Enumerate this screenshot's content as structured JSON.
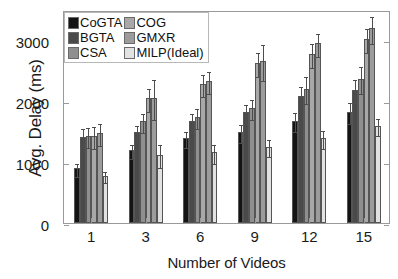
{
  "chart_data": {
    "type": "bar",
    "title": "",
    "xlabel": "Number of Videos",
    "ylabel": "Avg. Delay (ms)",
    "categories": [
      "1",
      "3",
      "6",
      "9",
      "12",
      "15"
    ],
    "ylim": [
      0,
      3500
    ],
    "yticks": [
      0,
      1000,
      2000,
      3000
    ],
    "ytick_labels": [
      "0",
      "1000",
      "2000",
      "3000"
    ],
    "grid": false,
    "legend_position": "upper-left-inside",
    "error_bars": true,
    "series": [
      {
        "name": "CoGTA",
        "color": "#141414",
        "values": [
          900,
          1200,
          1400,
          1500,
          1680,
          1830
        ],
        "err": [
          110,
          120,
          130,
          150,
          160,
          170
        ]
      },
      {
        "name": "BGTA",
        "color": "#4a4a4a",
        "values": [
          1420,
          1490,
          1680,
          1820,
          2080,
          2190
        ],
        "err": [
          160,
          140,
          150,
          160,
          190,
          190
        ]
      },
      {
        "name": "CSA",
        "color": "#8f8f8f",
        "values": [
          1430,
          1670,
          1740,
          1890,
          2210,
          2370
        ],
        "err": [
          170,
          160,
          170,
          170,
          220,
          220
        ]
      },
      {
        "name": "COG",
        "color": "#a8a8a8",
        "values": [
          1430,
          2050,
          2280,
          2630,
          2780,
          3020
        ],
        "err": [
          180,
          190,
          180,
          190,
          200,
          200
        ]
      },
      {
        "name": "GMXR",
        "color": "#9c9c9c",
        "values": [
          1480,
          2050,
          2340,
          2660,
          2950,
          3200
        ],
        "err": [
          180,
          330,
          180,
          290,
          190,
          220
        ]
      },
      {
        "name": "MILP(Ideal)",
        "color": "#e2e2e2",
        "values": [
          780,
          1120,
          1160,
          1250,
          1400,
          1600
        ],
        "err": [
          90,
          190,
          150,
          140,
          150,
          140
        ]
      }
    ]
  },
  "legend": {
    "entries": [
      {
        "label": "CoGTA",
        "color": "#141414"
      },
      {
        "label": "COG",
        "color": "#a8a8a8"
      },
      {
        "label": "BGTA",
        "color": "#4a4a4a"
      },
      {
        "label": "GMXR",
        "color": "#9c9c9c"
      },
      {
        "label": "CSA",
        "color": "#8f8f8f"
      },
      {
        "label": "MILP(Ideal)",
        "color": "#e2e2e2"
      }
    ]
  }
}
